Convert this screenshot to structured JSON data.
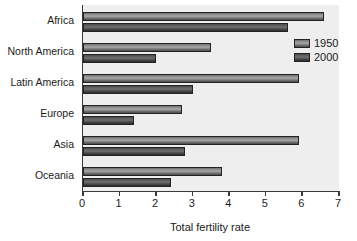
{
  "chart_data": {
    "type": "bar",
    "orientation": "horizontal",
    "title": "",
    "xlabel": "Total fertility rate",
    "ylabel": "",
    "categories": [
      "Africa",
      "North America",
      "Latin America",
      "Europe",
      "Asia",
      "Oceania"
    ],
    "series": [
      {
        "name": "1950",
        "values": [
          6.6,
          3.5,
          5.9,
          2.7,
          5.9,
          3.8
        ],
        "color": "#8e8e8e"
      },
      {
        "name": "2000",
        "values": [
          5.6,
          2.0,
          3.0,
          1.4,
          2.8,
          2.4
        ],
        "color": "#4a4a4a"
      }
    ],
    "xlim": [
      0,
      7
    ],
    "xticks": [
      0,
      1,
      2,
      3,
      4,
      5,
      6,
      7
    ],
    "xtick_labels": [
      "0",
      "1",
      "2",
      "3",
      "4",
      "5",
      "6",
      "7"
    ],
    "grid": false,
    "legend_position": "top-right",
    "plot_background": "#eeeeee"
  },
  "legend": {
    "entries": [
      {
        "label": "1950"
      },
      {
        "label": "2000"
      }
    ]
  },
  "axis": {
    "x_title": "Total fertility rate"
  }
}
